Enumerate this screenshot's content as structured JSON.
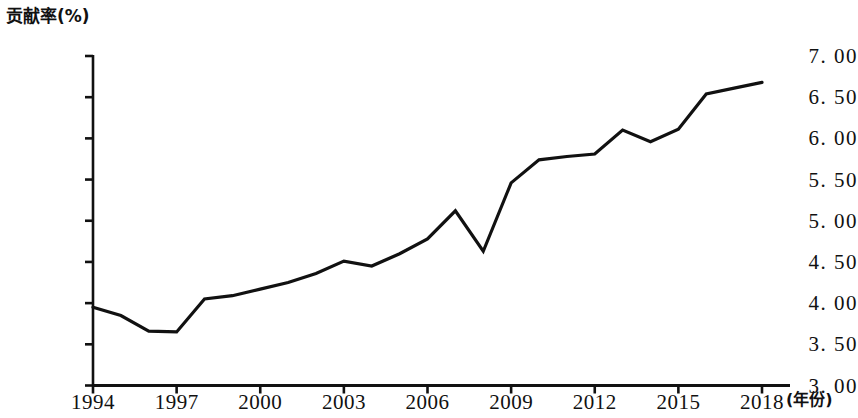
{
  "chart_data": {
    "type": "line",
    "title": "",
    "ylabel": "贡献率(%)",
    "xlabel": "(年份)",
    "grid": false,
    "legend": false,
    "ylim": [
      3.0,
      7.0
    ],
    "ytick_labels": [
      "7. 00",
      "6. 50",
      "6. 00",
      "5. 50",
      "5. 00",
      "4. 50",
      "4. 00",
      "3. 50",
      "3. 00"
    ],
    "ytick_values": [
      7.0,
      6.5,
      6.0,
      5.5,
      5.0,
      4.5,
      4.0,
      3.5,
      3.0
    ],
    "xlim": [
      1994,
      2018
    ],
    "xtick_labels": [
      "1994",
      "1997",
      "2000",
      "2003",
      "2006",
      "2009",
      "2012",
      "2015",
      "2018"
    ],
    "xtick_values": [
      1994,
      1997,
      2000,
      2003,
      2006,
      2009,
      2012,
      2015,
      2018
    ],
    "x": [
      1994,
      1995,
      1996,
      1997,
      1998,
      1999,
      2000,
      2001,
      2002,
      2003,
      2004,
      2005,
      2006,
      2007,
      2008,
      2009,
      2010,
      2011,
      2012,
      2013,
      2014,
      2015,
      2016,
      2017,
      2018
    ],
    "values": [
      3.95,
      3.85,
      3.66,
      3.65,
      4.05,
      4.09,
      4.17,
      4.25,
      4.36,
      4.51,
      4.45,
      4.6,
      4.78,
      5.12,
      4.63,
      5.46,
      5.74,
      5.78,
      5.81,
      6.1,
      5.96,
      6.11,
      6.54,
      6.61,
      6.68
    ],
    "series_name": "贡献率",
    "line_color": "#111111",
    "line_width": 3.2
  }
}
